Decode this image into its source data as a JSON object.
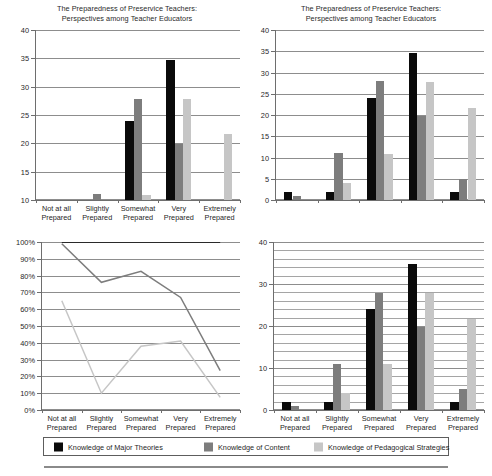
{
  "document": {
    "figure_title": "The Preparedness of Preservice Teachers: Perspectives among Teacher Educators"
  },
  "categories": [
    "Not at all Prepared",
    "Slightly Prepared",
    "Somewhat Prepared",
    "Very Prepared",
    "Extremely Prepared"
  ],
  "categories_short": [
    "Not at all",
    "Slightly",
    "Somewhat",
    "Very",
    "Extremely"
  ],
  "category_line2": "Prepared",
  "series_colors": {
    "major_theories": "#0a0a0a",
    "content": "#7d7d7d",
    "pedagogical_strategies": "#c6c6c6"
  },
  "legend": {
    "items": [
      {
        "label": "Knowledge of Major Theories",
        "color": "#0a0a0a"
      },
      {
        "label": "Knowledge of Content",
        "color": "#7d7d7d"
      },
      {
        "label": "Knowledge of Pedagogical Strategies",
        "color": "#c6c6c6"
      }
    ]
  },
  "chart_data": [
    {
      "id": "top-left-truncated-bar",
      "type": "bar",
      "title": "The Preparedness of Preservice Teachers: Perspectives among Teacher Educators",
      "xlabel": "",
      "ylabel": "",
      "ylim": [
        10,
        40
      ],
      "yticks": [
        10,
        15,
        20,
        25,
        30,
        35,
        40
      ],
      "ytick_labels": [
        "10",
        "15",
        "20",
        "25",
        "30",
        "35",
        "40"
      ],
      "grid": true,
      "categories": [
        "Not at all Prepared",
        "Slightly Prepared",
        "Somewhat Prepared",
        "Very Prepared",
        "Extremely Prepared"
      ],
      "series": [
        {
          "name": "Knowledge of Major Theories",
          "color": "#0a0a0a",
          "values": [
            2,
            2,
            24,
            34.7,
            1.8
          ]
        },
        {
          "name": "Knowledge of Content",
          "color": "#7d7d7d",
          "values": [
            0.9,
            11,
            27.9,
            19.8,
            5
          ]
        },
        {
          "name": "Knowledge of Pedagogical Strategies",
          "color": "#c6c6c6",
          "values": [
            0,
            4,
            10.9,
            27.8,
            21.7
          ]
        }
      ],
      "note": "Y axis truncated at 10; bars below 10 are not visible."
    },
    {
      "id": "top-right-full-bar",
      "type": "bar",
      "title": "The Preparedness of Preservice Teachers: Perspectives among Teacher Educators",
      "xlabel": "",
      "ylabel": "",
      "ylim": [
        0,
        40
      ],
      "yticks": [
        0,
        5,
        10,
        15,
        20,
        25,
        30,
        35,
        40
      ],
      "ytick_labels": [
        "0",
        "5",
        "10",
        "15",
        "20",
        "25",
        "30",
        "35",
        "40"
      ],
      "grid": true,
      "show_xticklabels": false,
      "categories": [
        "Not at all Prepared",
        "Slightly Prepared",
        "Somewhat Prepared",
        "Very Prepared",
        "Extremely Prepared"
      ],
      "series": [
        {
          "name": "Knowledge of Major Theories",
          "color": "#0a0a0a",
          "values": [
            2,
            2,
            24,
            34.7,
            1.8
          ]
        },
        {
          "name": "Knowledge of Content",
          "color": "#7d7d7d",
          "values": [
            0.9,
            11,
            27.9,
            19.8,
            5
          ]
        },
        {
          "name": "Knowledge of Pedagogical Strategies",
          "color": "#c6c6c6",
          "values": [
            0,
            4,
            10.9,
            27.8,
            21.7
          ]
        }
      ]
    },
    {
      "id": "bottom-left-line",
      "type": "line",
      "title": "",
      "xlabel": "",
      "ylabel": "",
      "ylim": [
        0,
        100
      ],
      "yticks": [
        0,
        10,
        20,
        30,
        40,
        50,
        60,
        70,
        80,
        90,
        100
      ],
      "ytick_labels": [
        "0%",
        "10%",
        "20%",
        "30%",
        "40%",
        "50%",
        "60%",
        "70%",
        "80%",
        "90%",
        "100%"
      ],
      "grid": true,
      "categories": [
        "Not at all Prepared",
        "Slightly Prepared",
        "Somewhat Prepared",
        "Very Prepared",
        "Extremely Prepared"
      ],
      "series": [
        {
          "name": "Knowledge of Major Theories",
          "color": "#0a0a0a",
          "values": [
            100,
            100,
            100,
            100,
            100
          ]
        },
        {
          "name": "Knowledge of Content",
          "color": "#7d7d7d",
          "values": [
            99,
            76,
            82.5,
            67,
            23.5
          ]
        },
        {
          "name": "Knowledge of Pedagogical Strategies",
          "color": "#c6c6c6",
          "values": [
            65,
            10,
            38,
            41,
            7.5
          ]
        }
      ]
    },
    {
      "id": "bottom-right-dense-grid-bar",
      "type": "bar",
      "title": "",
      "xlabel": "",
      "ylabel": "",
      "ylim": [
        0,
        40
      ],
      "yticks": [
        0,
        10,
        20,
        30,
        40
      ],
      "ytick_labels": [
        "0",
        "10",
        "20",
        "30",
        "40"
      ],
      "minor_tick_step": 2,
      "grid": true,
      "categories": [
        "Not at all Prepared",
        "Slightly Prepared",
        "Somewhat Prepared",
        "Very Prepared",
        "Extremely Prepared"
      ],
      "series": [
        {
          "name": "Knowledge of Major Theories",
          "color": "#0a0a0a",
          "values": [
            2,
            2,
            24,
            34.7,
            1.8
          ]
        },
        {
          "name": "Knowledge of Content",
          "color": "#7d7d7d",
          "values": [
            0.9,
            11,
            27.9,
            19.8,
            5
          ]
        },
        {
          "name": "Knowledge of Pedagogical Strategies",
          "color": "#c6c6c6",
          "values": [
            0,
            4,
            10.9,
            27.8,
            21.7
          ]
        }
      ]
    }
  ]
}
